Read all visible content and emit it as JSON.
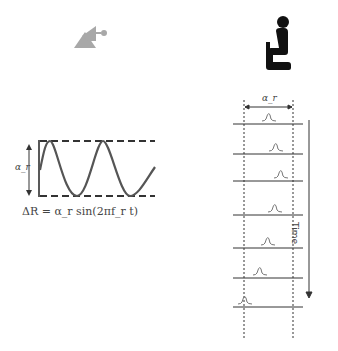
{
  "diagram": {
    "left_panel": {
      "icon": "radar-antenna-icon",
      "amplitude_label": "α_r",
      "formula": "ΔR = α_r sin(2πf_r t)"
    },
    "right_panel": {
      "icon": "seated-person-icon",
      "range_label": "α_r",
      "axis_label": "Time",
      "frames": 7
    },
    "colors": {
      "line": "#333333",
      "wave": "#555555",
      "icon_gray": "#a8a8a8",
      "icon_black": "#111111"
    }
  }
}
